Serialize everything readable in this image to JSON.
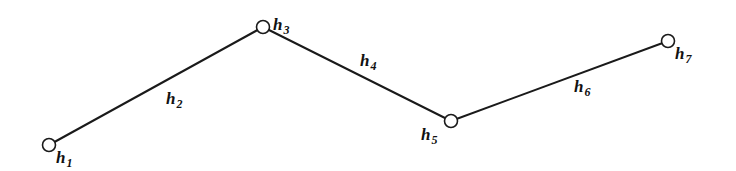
{
  "diagram": {
    "type": "polyline-chain",
    "nodes": [
      {
        "id": "h1",
        "base": "h",
        "sub": "1",
        "x": 49,
        "y": 145,
        "lx": 56,
        "ly": 163
      },
      {
        "id": "h3",
        "base": "h",
        "sub": "3",
        "x": 263,
        "y": 27,
        "lx": 273,
        "ly": 30
      },
      {
        "id": "h5",
        "base": "h",
        "sub": "5",
        "x": 451,
        "y": 121,
        "lx": 421,
        "ly": 140
      },
      {
        "id": "h7",
        "base": "h",
        "sub": "7",
        "x": 668,
        "y": 41,
        "lx": 675,
        "ly": 59
      }
    ],
    "edges": [
      {
        "id": "h2",
        "from": "h1",
        "to": "h3",
        "base": "h",
        "sub": "2",
        "lx": 166,
        "ly": 104
      },
      {
        "id": "h4",
        "from": "h3",
        "to": "h5",
        "base": "h",
        "sub": "4",
        "lx": 360,
        "ly": 66
      },
      {
        "id": "h6",
        "from": "h5",
        "to": "h7",
        "base": "h",
        "sub": "6",
        "lx": 574,
        "ly": 92
      }
    ]
  }
}
